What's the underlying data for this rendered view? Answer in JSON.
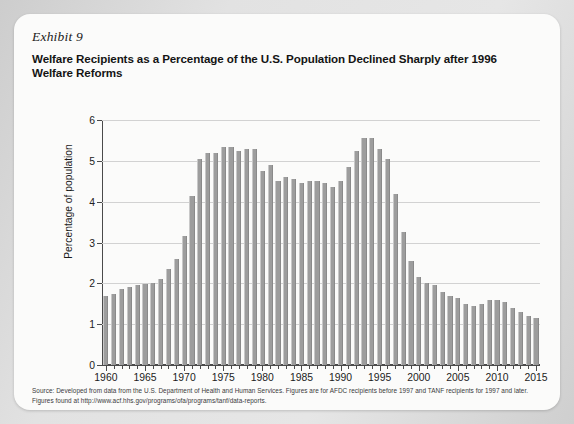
{
  "exhibit": {
    "label": "Exhibit 9",
    "title": "Welfare Recipients as a Percentage of the U.S. Population Declined Sharply after 1996 Welfare Reforms"
  },
  "source_note": "Source: Developed from data from the U.S. Department of Health and Human Services. Figures are for AFDC recipients before 1997 and TANF recipients for 1997 and later. Figures found at http://www.acf.hhs.gov/programs/ofa/programs/tanf/data-reports.",
  "colors": {
    "bar": "#9d9d9d",
    "bar_edge_light": "#c8c8c8",
    "bar_edge_dark": "#8a8a8a",
    "gridline": "#d2d2d2",
    "axis": "#4a4a4a",
    "card_background": "#fbfbfa",
    "page_background": "#d9d9d9",
    "text": "#141414"
  },
  "chart_data": {
    "type": "bar",
    "title": "Welfare Recipients as a Percentage of the U.S. Population Declined Sharply after 1996 Welfare Reforms",
    "xlabel": "",
    "ylabel": "Percentage of population",
    "ylim": [
      0,
      6
    ],
    "yticks": [
      0,
      1,
      2,
      3,
      4,
      5,
      6
    ],
    "xlim": [
      1959.5,
      2015.5
    ],
    "xtick_labels": [
      1960,
      1965,
      1970,
      1975,
      1980,
      1985,
      1990,
      1995,
      2000,
      2005,
      2010,
      2015
    ],
    "grid": true,
    "legend": null,
    "categories": [
      1960,
      1961,
      1962,
      1963,
      1964,
      1965,
      1966,
      1967,
      1968,
      1969,
      1970,
      1971,
      1972,
      1973,
      1974,
      1975,
      1976,
      1977,
      1978,
      1979,
      1980,
      1981,
      1982,
      1983,
      1984,
      1985,
      1986,
      1987,
      1988,
      1989,
      1990,
      1991,
      1992,
      1993,
      1994,
      1995,
      1996,
      1997,
      1998,
      1999,
      2000,
      2001,
      2002,
      2003,
      2004,
      2005,
      2006,
      2007,
      2008,
      2009,
      2010,
      2011,
      2012,
      2013,
      2014,
      2015
    ],
    "values": [
      1.7,
      1.75,
      1.85,
      1.9,
      1.95,
      1.98,
      2.0,
      2.1,
      2.35,
      2.6,
      3.15,
      4.15,
      5.05,
      5.2,
      5.2,
      5.35,
      5.35,
      5.25,
      5.3,
      5.3,
      4.75,
      4.9,
      4.5,
      4.6,
      4.55,
      4.45,
      4.5,
      4.5,
      4.45,
      4.35,
      4.5,
      4.85,
      5.25,
      5.55,
      5.55,
      5.3,
      5.05,
      4.2,
      3.25,
      2.55,
      2.15,
      2.0,
      1.95,
      1.8,
      1.7,
      1.65,
      1.5,
      1.45,
      1.5,
      1.6,
      1.6,
      1.55,
      1.4,
      1.3,
      1.2,
      1.15
    ]
  }
}
